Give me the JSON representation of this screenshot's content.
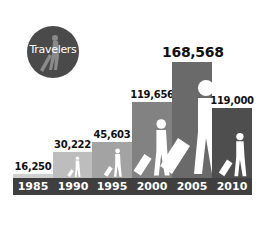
{
  "badge": {
    "label": "Travelers",
    "icon": "traveler-with-suitcase-icon",
    "color": "#4a4a4a"
  },
  "chart_data": {
    "type": "bar",
    "title": "Travelers",
    "categories": [
      "1985",
      "1990",
      "1995",
      "2000",
      "2005",
      "2010"
    ],
    "values": [
      16250,
      30222,
      45603,
      119656,
      168568,
      119000
    ],
    "value_labels": [
      "16,250",
      "30,222",
      "45,603",
      "119,656",
      "168,568",
      "119,000"
    ],
    "xlabel": "",
    "ylabel": "",
    "grid": false,
    "legend": "none",
    "highlight": {
      "category": "2005",
      "label": "168,568"
    },
    "bar_colors": [
      "#cfcfcf",
      "#bdbdbd",
      "#a3a3a3",
      "#828282",
      "#6a6a6a",
      "#4e4e4e"
    ],
    "strip_color": "#3f3f3f"
  }
}
